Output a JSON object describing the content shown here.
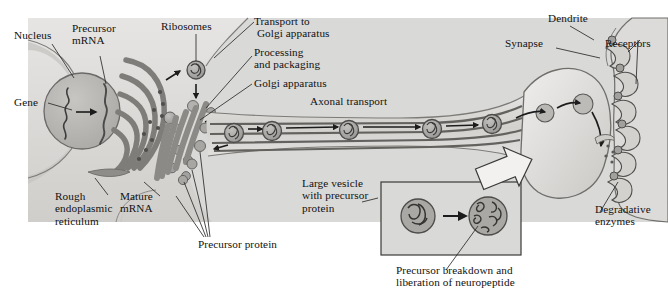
{
  "figure": {
    "background_color": "#ffffff",
    "panel_color": "#d9d9d7",
    "cytoplasm_color": "#dedddb",
    "organelle_color": "#8e8e8e",
    "organelle_dark": "#6f6f6f",
    "vesicle_color": "#a8a8a8",
    "outline_color": "#3a3a3a",
    "label_color": "#111111",
    "panel": {
      "x": 28,
      "y": 18,
      "width": 640,
      "height": 204
    }
  },
  "labels": {
    "nucleus": "Nucleus",
    "precursor_mrna": "Precursor\nmRNA",
    "gene": "Gene",
    "ribosomes": "Ribosomes",
    "transport_to_golgi": "Transport to\n Golgi apparatus",
    "processing_and_packaging": "Processing\nand packaging",
    "golgi_apparatus": "Golgi apparatus",
    "axonal_transport": "Axonal transport",
    "rough_er": "Rough\nendoplasmic\nreticulum",
    "mature_mrna": "Mature\nmRNA",
    "precursor_protein": "Precursor protein",
    "large_vesicle": "Large vesicle\nwith precursor\nprotein",
    "inset_caption": "Precursor breakdown and\nliberation of neuropeptide",
    "dendrite": "Dendrite",
    "synapse": "Synapse",
    "receptors": "Receptors",
    "degradative_enzymes": "Degradative\nenzymes"
  },
  "structures": {
    "nucleus": {
      "name": "nucleus",
      "cx": 82,
      "cy": 111,
      "r": 38
    },
    "gene_arrow": {
      "name": "transcription-arrow"
    },
    "rough_er": {
      "name": "rough-endoplasmic-reticulum",
      "cisternae": 5
    },
    "golgi": {
      "name": "golgi-apparatus",
      "stacks": 5
    },
    "free_ribosome": {
      "name": "free-ribosome",
      "cx": 196,
      "cy": 70,
      "r": 9
    },
    "axon": {
      "name": "axon",
      "microtubules": 4
    },
    "axon_vesicles": [
      {
        "cx": 234,
        "cy": 133
      },
      {
        "cx": 272,
        "cy": 131
      },
      {
        "cx": 349,
        "cy": 130
      },
      {
        "cx": 432,
        "cy": 129
      },
      {
        "cx": 492,
        "cy": 125
      }
    ],
    "terminal_vesicles": [
      {
        "cx": 545,
        "cy": 113,
        "r": 9
      },
      {
        "cx": 583,
        "cy": 104,
        "r": 10
      }
    ],
    "synaptic_cleft": {
      "name": "synaptic-cleft"
    },
    "receptors_count": 6,
    "enzyme_dots": 6,
    "inset": {
      "x": 381,
      "y": 182,
      "width": 140,
      "height": 73
    }
  }
}
